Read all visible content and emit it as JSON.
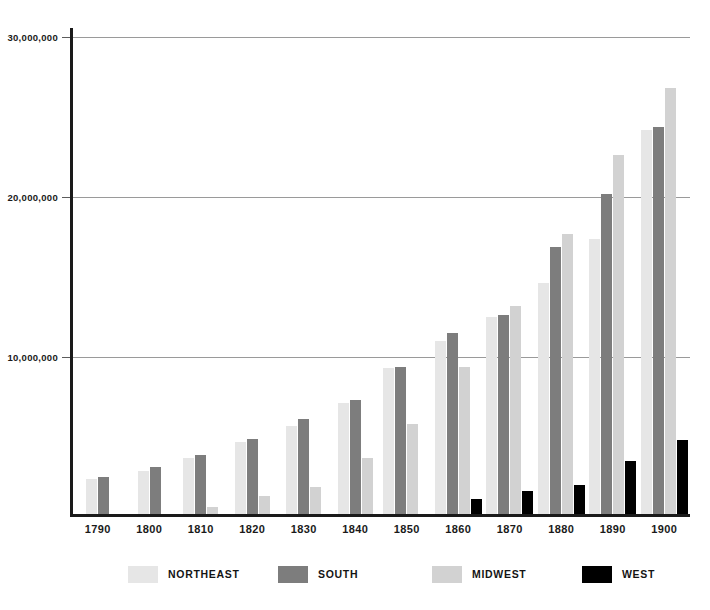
{
  "chart_data": {
    "type": "bar",
    "title": "",
    "subtitle": "",
    "xlabel": "",
    "ylabel": "",
    "categories": [
      "1790",
      "1800",
      "1810",
      "1820",
      "1830",
      "1840",
      "1850",
      "1860",
      "1870",
      "1880",
      "1890",
      "1900"
    ],
    "ylim": [
      0,
      30000000
    ],
    "yticks": [
      10000000,
      20000000,
      30000000
    ],
    "ytick_labels": [
      "10,000,000",
      "20,000,000",
      "30,000,000"
    ],
    "grid": true,
    "legend_position": "bottom",
    "series": [
      {
        "name": "NORTHEAST",
        "color": "#e6e6e6",
        "values": [
          2400000,
          2900000,
          3700000,
          4700000,
          5700000,
          7100000,
          9300000,
          11000000,
          12500000,
          14600000,
          17400000,
          24200000
        ]
      },
      {
        "name": "SOUTH",
        "color": "#7d7d7d",
        "values": [
          2500000,
          3100000,
          3900000,
          4900000,
          6100000,
          7300000,
          9400000,
          11500000,
          12600000,
          16900000,
          20200000,
          24400000
        ]
      },
      {
        "name": "MIDWEST",
        "color": "#d2d2d2",
        "values": [
          0,
          0,
          600000,
          1300000,
          1900000,
          3700000,
          5800000,
          9400000,
          13200000,
          17700000,
          22600000,
          26800000
        ]
      },
      {
        "name": "WEST",
        "color": "#000000",
        "values": [
          0,
          0,
          0,
          0,
          0,
          0,
          180000,
          1100000,
          1600000,
          2000000,
          3500000,
          4800000
        ]
      }
    ]
  },
  "legend": {
    "items": [
      {
        "label": "NORTHEAST",
        "color": "#e6e6e6"
      },
      {
        "label": "SOUTH",
        "color": "#7d7d7d"
      },
      {
        "label": "MIDWEST",
        "color": "#d2d2d2"
      },
      {
        "label": "WEST",
        "color": "#000000"
      }
    ]
  },
  "axis": {
    "y_max_label": "30,000,000",
    "y_mid_label": "20,000,000",
    "y_min_label": "10,000,000"
  }
}
